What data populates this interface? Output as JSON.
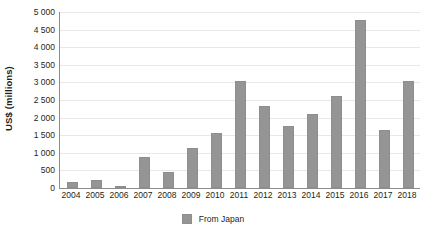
{
  "chart_data": {
    "type": "bar",
    "title": "",
    "subtitle": "",
    "xlabel": "",
    "ylabel": "US$ (millions)",
    "ylim": [
      0,
      5000
    ],
    "ytick_step": 500,
    "grid": true,
    "legend_position": "bottom-center",
    "categories": [
      "2004",
      "2005",
      "2006",
      "2007",
      "2008",
      "2009",
      "2010",
      "2011",
      "2012",
      "2013",
      "2014",
      "2015",
      "2016",
      "2017",
      "2018"
    ],
    "ytick_labels": [
      "0",
      "500",
      "1 000",
      "1 500",
      "2 000",
      "2 500",
      "3 000",
      "3 500",
      "4 000",
      "4 500",
      "5 000"
    ],
    "ytick_values": [
      0,
      500,
      1000,
      1500,
      2000,
      2500,
      3000,
      3500,
      4000,
      4500,
      5000
    ],
    "series": [
      {
        "name": "From Japan",
        "color": "#959595",
        "values": [
          170,
          215,
          70,
          870,
          450,
          1150,
          1570,
          3030,
          2320,
          1760,
          2110,
          2620,
          4760,
          1650,
          3040
        ]
      }
    ]
  },
  "legend": {
    "items": [
      {
        "label": "From Japan",
        "color": "#959595"
      }
    ]
  },
  "colors": {
    "bar": "#959595",
    "bar_border": "#8e8e8e",
    "axis": "#8c8c8c",
    "gridline": "#e8e8e8",
    "text": "#231f20",
    "background": "#ffffff"
  }
}
